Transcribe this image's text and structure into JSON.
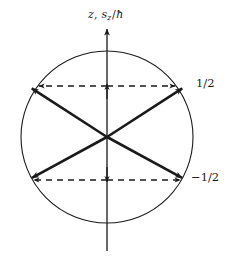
{
  "figure": {
    "background_color": "#ffffff",
    "stroke_color": "#1a1a1a",
    "axis": {
      "label_var": "z",
      "label_sep": ", ",
      "label_observable": "s",
      "label_subscript": "z",
      "label_slash": "/",
      "label_hbar": "ħ",
      "label_full": "z, s₂/ħ",
      "orientation": "vertical",
      "arrow_head": "up"
    },
    "circle": {
      "center_x": 107,
      "center_y": 137,
      "radius": 86,
      "stroke_width": 1.1,
      "fill": "none"
    },
    "levels": [
      {
        "name": "spin-up",
        "label": "1/2",
        "value": 0.5,
        "y": 86,
        "style": "dashed",
        "arrow_heads": "both"
      },
      {
        "name": "spin-down",
        "label": "−1/2",
        "value": -0.5,
        "y": 180,
        "style": "dashed",
        "arrow_heads": "both"
      }
    ],
    "vectors": [
      {
        "name": "upper-right",
        "x1": 107,
        "y1": 137,
        "x2": 186,
        "y2": 86
      },
      {
        "name": "upper-left",
        "x1": 107,
        "y1": 137,
        "x2": 28,
        "y2": 86
      },
      {
        "name": "lower-right",
        "x1": 107,
        "y1": 137,
        "x2": 186,
        "y2": 180
      },
      {
        "name": "lower-left",
        "x1": 107,
        "y1": 137,
        "x2": 28,
        "y2": 180
      }
    ]
  }
}
